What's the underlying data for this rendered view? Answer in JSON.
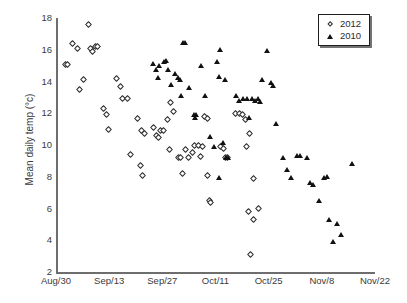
{
  "chart_data": {
    "type": "scatter",
    "title": "",
    "xlabel": "",
    "ylabel": "Mean daily temp (°c)",
    "ylim": [
      2,
      18
    ],
    "yticks": [
      2,
      4,
      6,
      8,
      10,
      12,
      14,
      16,
      18
    ],
    "xlim": [
      0,
      84
    ],
    "xticks": [
      0,
      14,
      28,
      42,
      56,
      70,
      84
    ],
    "xticklabels": [
      "Aug/30",
      "Sep/13",
      "Sep/27",
      "Oct/11",
      "Oct/25",
      "Nov/8",
      "Nov/22"
    ],
    "grid": false,
    "legend_position": "top-right",
    "series": [
      {
        "name": "2012",
        "marker": "open-diamond",
        "color": "#2b2b2b",
        "points": [
          [
            2.6,
            15.1
          ],
          [
            3.1,
            15.1
          ],
          [
            4.4,
            16.4
          ],
          [
            5.6,
            16.1
          ],
          [
            6.2,
            13.5
          ],
          [
            7.3,
            14.1
          ],
          [
            9.0,
            16.1
          ],
          [
            9.6,
            15.9
          ],
          [
            10.4,
            16.2
          ],
          [
            8.5,
            17.6
          ],
          [
            11.0,
            16.2
          ],
          [
            12.6,
            12.3
          ],
          [
            13.2,
            11.9
          ],
          [
            13.8,
            11.0
          ],
          [
            15.9,
            14.2
          ],
          [
            17.0,
            13.7
          ],
          [
            17.6,
            12.9
          ],
          [
            18.8,
            12.9
          ],
          [
            19.6,
            9.4
          ],
          [
            21.4,
            11.7
          ],
          [
            22.6,
            10.9
          ],
          [
            23.3,
            10.7
          ],
          [
            22.2,
            8.7
          ],
          [
            22.8,
            8.1
          ],
          [
            25.6,
            11.1
          ],
          [
            26.4,
            10.6
          ],
          [
            26.9,
            10.5
          ],
          [
            27.6,
            10.9
          ],
          [
            28.3,
            10.9
          ],
          [
            29.4,
            11.6
          ],
          [
            30.2,
            12.7
          ],
          [
            31.0,
            12.1
          ],
          [
            29.9,
            9.7
          ],
          [
            32.2,
            9.2
          ],
          [
            32.9,
            9.2
          ],
          [
            34.0,
            9.7
          ],
          [
            34.8,
            9.2
          ],
          [
            33.4,
            8.2
          ],
          [
            36.4,
            10.0
          ],
          [
            37.4,
            10.0
          ],
          [
            36.0,
            9.5
          ],
          [
            38.1,
            9.3
          ],
          [
            39.2,
            11.8
          ],
          [
            39.8,
            11.7
          ],
          [
            38.6,
            9.9
          ],
          [
            40.0,
            8.1
          ],
          [
            40.4,
            6.5
          ],
          [
            40.6,
            6.4
          ],
          [
            43.2,
            9.9
          ],
          [
            44.0,
            9.8
          ],
          [
            44.6,
            9.2
          ],
          [
            45.1,
            9.2
          ],
          [
            47.2,
            12.0
          ],
          [
            48.3,
            12.0
          ],
          [
            49.1,
            11.9
          ],
          [
            49.9,
            11.6
          ],
          [
            50.2,
            9.9
          ],
          [
            51.0,
            10.7
          ],
          [
            51.9,
            7.9
          ],
          [
            50.6,
            5.8
          ],
          [
            52.0,
            5.3
          ],
          [
            53.4,
            6.0
          ],
          [
            51.3,
            3.1
          ]
        ]
      },
      {
        "name": "2010",
        "marker": "filled-triangle",
        "color": "#111111",
        "points": [
          [
            25.6,
            15.1
          ],
          [
            26.4,
            14.7
          ],
          [
            27.2,
            15.0
          ],
          [
            27.0,
            14.2
          ],
          [
            28.6,
            15.2
          ],
          [
            29.2,
            15.3
          ],
          [
            29.6,
            14.7
          ],
          [
            30.4,
            13.8
          ],
          [
            31.4,
            14.5
          ],
          [
            32.2,
            14.2
          ],
          [
            32.8,
            14.1
          ],
          [
            33.6,
            16.4
          ],
          [
            34.2,
            16.4
          ],
          [
            33.0,
            13.1
          ],
          [
            35.2,
            13.6
          ],
          [
            36.4,
            11.9
          ],
          [
            36.9,
            11.9
          ],
          [
            36.6,
            11.7
          ],
          [
            38.4,
            15.0
          ],
          [
            39.4,
            13.1
          ],
          [
            40.6,
            10.5
          ],
          [
            42.4,
            15.2
          ],
          [
            43.2,
            16.0
          ],
          [
            43.0,
            14.3
          ],
          [
            44.6,
            14.1
          ],
          [
            44.2,
            10.1
          ],
          [
            44.8,
            9.2
          ],
          [
            45.4,
            9.2
          ],
          [
            42.9,
            7.9
          ],
          [
            41.6,
            9.9
          ],
          [
            47.4,
            13.1
          ],
          [
            48.2,
            12.8
          ],
          [
            49.4,
            12.9
          ],
          [
            50.4,
            12.9
          ],
          [
            51.0,
            11.7
          ],
          [
            51.8,
            12.9
          ],
          [
            52.6,
            12.8
          ],
          [
            53.2,
            12.9
          ],
          [
            53.8,
            12.7
          ],
          [
            54.4,
            14.1
          ],
          [
            55.6,
            15.9
          ],
          [
            56.6,
            13.9
          ],
          [
            57.2,
            13.7
          ],
          [
            58.0,
            11.3
          ],
          [
            60.0,
            9.2
          ],
          [
            61.0,
            8.4
          ],
          [
            62.0,
            7.9
          ],
          [
            63.6,
            9.3
          ],
          [
            64.4,
            9.3
          ],
          [
            66.2,
            9.2
          ],
          [
            67.0,
            7.6
          ],
          [
            67.8,
            7.5
          ],
          [
            69.4,
            6.5
          ],
          [
            70.6,
            7.9
          ],
          [
            71.4,
            8.0
          ],
          [
            72.0,
            5.3
          ],
          [
            74.0,
            5.0
          ],
          [
            73.0,
            3.9
          ],
          [
            75.2,
            4.3
          ],
          [
            78.0,
            8.8
          ]
        ]
      }
    ]
  },
  "legend": {
    "entries": [
      {
        "label": "2012",
        "marker": "open-diamond"
      },
      {
        "label": "2010",
        "marker": "filled-triangle"
      }
    ]
  }
}
